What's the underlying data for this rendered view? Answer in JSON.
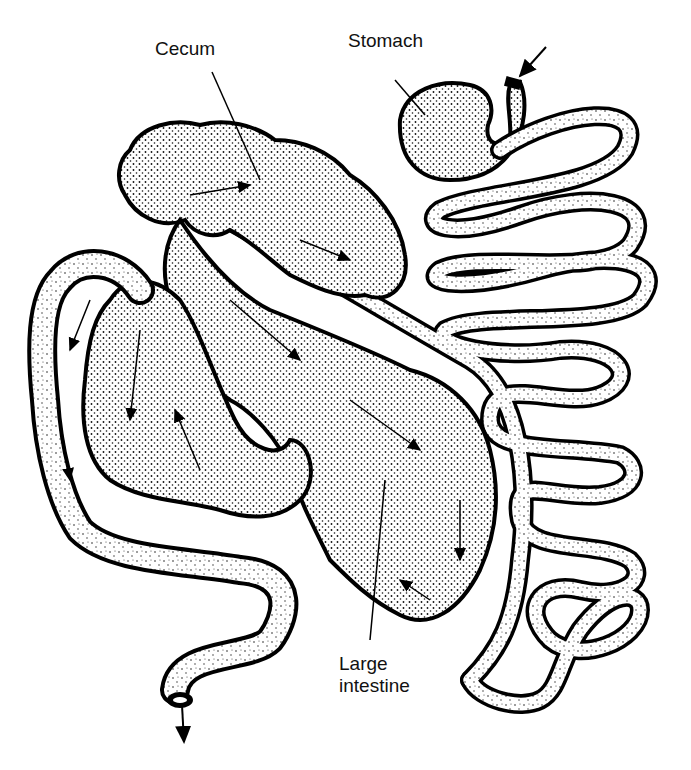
{
  "diagram": {
    "type": "anatomical illustration of digestive tract",
    "colors": {
      "outline": "#000000",
      "fill": "#ffffff",
      "stipple": "#222222"
    },
    "labels": {
      "cecum": "Cecum",
      "stomach": "Stomach",
      "large_intestine_line1": "Large",
      "large_intestine_line2": "intestine"
    },
    "arrows": {
      "inflow": "arrow into esophagus (top right)",
      "outflow": "arrow out of rectum (bottom left)"
    }
  }
}
